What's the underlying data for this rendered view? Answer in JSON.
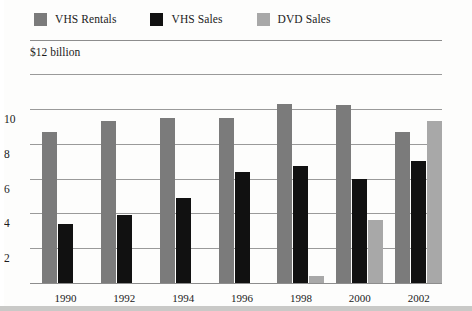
{
  "legend": {
    "items": [
      {
        "label": "VHS Rentals",
        "color": "#7b7b7b",
        "key": "vhs_rentals"
      },
      {
        "label": "VHS Sales",
        "color": "#111111",
        "key": "vhs_sales"
      },
      {
        "label": "DVD Sales",
        "color": "#a8a8a8",
        "key": "dvd_sales"
      }
    ]
  },
  "axis": {
    "unit_caption": "$12 billion",
    "y_ticks": [
      "10",
      "8",
      "6",
      "4",
      "2"
    ],
    "x_ticks": [
      "1990",
      "1992",
      "1994",
      "1996",
      "1998",
      "2000",
      "2002"
    ]
  },
  "chart_data": {
    "type": "bar",
    "title": "",
    "subtitle": "",
    "xlabel": "",
    "ylabel": "$12 billion",
    "ylim": [
      0,
      12
    ],
    "yticks": [
      2,
      4,
      6,
      8,
      10
    ],
    "grid": true,
    "legend_position": "top-left",
    "categories": [
      "1990",
      "1992",
      "1994",
      "1996",
      "1998",
      "2000",
      "2002"
    ],
    "series": [
      {
        "name": "VHS Rentals",
        "color": "#7b7b7b",
        "values": [
          8.7,
          9.3,
          9.45,
          9.5,
          10.3,
          10.2,
          8.7
        ]
      },
      {
        "name": "VHS Sales",
        "color": "#111111",
        "values": [
          3.4,
          3.9,
          4.9,
          6.4,
          6.7,
          6.0,
          7.0
        ]
      },
      {
        "name": "DVD Sales",
        "color": "#a8a8a8",
        "values": [
          0,
          0,
          0,
          0,
          0.4,
          3.6,
          9.3
        ]
      }
    ]
  }
}
